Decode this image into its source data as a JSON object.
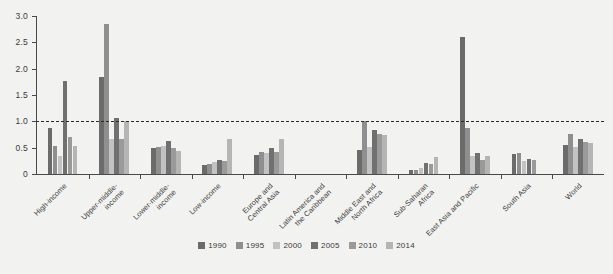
{
  "chart_data": {
    "type": "bar",
    "title": "",
    "xlabel": "",
    "ylabel": "",
    "ylim": [
      0,
      3.0
    ],
    "yticks": [
      "0",
      "0.5",
      "1.0",
      "1.5",
      "2.0",
      "2.5",
      "3.0"
    ],
    "ytick_values": [
      0,
      0.5,
      1.0,
      1.5,
      2.0,
      2.5,
      3.0
    ],
    "grid": false,
    "legend_position": "bottom",
    "reference_line": {
      "value": 1.0,
      "style": "dashed",
      "color": "#2b2b2b"
    },
    "categories": [
      "High-income",
      "Upper-middle-\nincome",
      "Lower-middle-\nincome",
      "Low-income",
      "Europe and\nCentral Asia",
      "Latin America and\nthe Caribbean",
      "Middle East and\nNorth Africa",
      "Sub-Saharan\nAfrica",
      "East Asia and Pacific",
      "South Asia",
      "World"
    ],
    "series": [
      {
        "name": "1990",
        "color": "#6b6b6b",
        "values": [
          0.87,
          1.84,
          0.5,
          0.18,
          0.36,
          0.0,
          0.46,
          0.07,
          0.3,
          0.38,
          0.55
        ]
      },
      {
        "name": "1995",
        "color": "#8f8f8f",
        "values": [
          0.54,
          2.84,
          0.52,
          0.19,
          0.42,
          0.0,
          1.0,
          0.07,
          0.88,
          0.39,
          0.76
        ]
      },
      {
        "name": "2000",
        "color": "#c2c2c2",
        "values": [
          0.35,
          0.67,
          0.53,
          0.22,
          0.4,
          0.0,
          0.52,
          0.11,
          0.35,
          0.25,
          0.52
        ]
      },
      {
        "name": "2005",
        "color": "#707070",
        "values": [
          1.76,
          1.07,
          0.63,
          0.26,
          0.5,
          0.0,
          0.83,
          0.21,
          0.4,
          0.28,
          0.66
        ]
      },
      {
        "name": "2010",
        "color": "#9a9a9a",
        "values": [
          0.71,
          0.67,
          0.5,
          0.25,
          0.41,
          0.0,
          0.76,
          0.19,
          0.27,
          0.27,
          0.6
        ]
      },
      {
        "name": "2014",
        "color": "#b5b5b5",
        "values": [
          0.54,
          1.0,
          0.44,
          0.66,
          0.67,
          0.0,
          0.74,
          0.32,
          0.35,
          0.0,
          0.58
        ]
      }
    ],
    "special_bars": [
      {
        "category": "East Asia and Pacific",
        "series": "1990",
        "value": 2.6
      }
    ]
  },
  "legend": {
    "items": [
      {
        "label": "1990",
        "color": "#6b6b6b"
      },
      {
        "label": "1995",
        "color": "#8f8f8f"
      },
      {
        "label": "2000",
        "color": "#c2c2c2"
      },
      {
        "label": "2005",
        "color": "#707070"
      },
      {
        "label": "2010",
        "color": "#9a9a9a"
      },
      {
        "label": "2014",
        "color": "#b5b5b5"
      }
    ]
  },
  "colors": {
    "background": "#f2f2f0",
    "axis": "#4a4a4a",
    "text": "#3b3b3b",
    "reference_line": "#2b2b2b"
  }
}
